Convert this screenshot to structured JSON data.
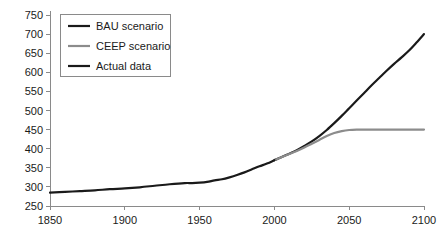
{
  "chart_data": {
    "type": "line",
    "title": "",
    "xlabel": "",
    "ylabel": "",
    "xlim": [
      1850,
      2100
    ],
    "ylim": [
      250,
      750
    ],
    "xticks": [
      1850,
      1900,
      1950,
      2000,
      2050,
      2100
    ],
    "yticks": [
      250,
      300,
      350,
      400,
      450,
      500,
      550,
      600,
      650,
      700,
      750
    ],
    "grid": false,
    "legend_position": "top-left",
    "series": [
      {
        "name": "BAU scenario",
        "color": "#1a1a1a",
        "width": 2.2,
        "x": [
          2000,
          2005,
          2010,
          2015,
          2020,
          2025,
          2030,
          2035,
          2040,
          2045,
          2050,
          2055,
          2060,
          2065,
          2070,
          2075,
          2080,
          2085,
          2090,
          2095,
          2100
        ],
        "values": [
          370,
          378,
          387,
          396,
          407,
          419,
          433,
          449,
          467,
          486,
          506,
          526,
          546,
          566,
          585,
          604,
          622,
          639,
          657,
          678,
          700
        ]
      },
      {
        "name": "CEEP scenario",
        "color": "#8c8c8c",
        "width": 2.2,
        "x": [
          2000,
          2005,
          2010,
          2015,
          2020,
          2025,
          2030,
          2035,
          2040,
          2045,
          2050,
          2055,
          2060,
          2070,
          2080,
          2090,
          2100
        ],
        "values": [
          370,
          378,
          386,
          394,
          403,
          413,
          423,
          433,
          441,
          446,
          449,
          450,
          450,
          450,
          450,
          450,
          450
        ]
      },
      {
        "name": "Actual data",
        "color": "#1a1a1a",
        "width": 2.2,
        "x": [
          1850,
          1860,
          1870,
          1880,
          1890,
          1900,
          1910,
          1920,
          1930,
          1940,
          1945,
          1950,
          1955,
          1960,
          1965,
          1970,
          1975,
          1980,
          1985,
          1990,
          1995,
          2000
        ],
        "values": [
          285,
          287,
          289,
          291,
          294,
          296,
          299,
          303,
          307,
          310,
          310,
          311,
          313,
          317,
          320,
          325,
          331,
          338,
          346,
          354,
          361,
          370
        ]
      }
    ],
    "legend": [
      {
        "label": "BAU scenario",
        "color": "#1a1a1a"
      },
      {
        "label": "CEEP scenario",
        "color": "#8c8c8c"
      },
      {
        "label": "Actual data",
        "color": "#1a1a1a"
      }
    ]
  }
}
